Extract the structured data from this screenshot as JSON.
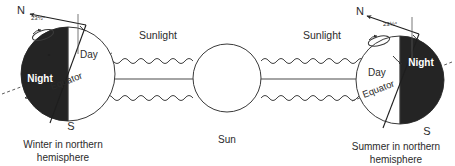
{
  "diagram": {
    "central_body": {
      "label": "Sun",
      "shape": "circle",
      "cx": 227,
      "cy": 78,
      "r": 34
    },
    "orbit_line_label": "",
    "axial_tilt_angle": "23½°",
    "sunlight_label_left": "Sunlight",
    "sunlight_label_right": "Sunlight",
    "earth_left": {
      "caption_line1": "Winter in northern",
      "caption_line2": "hemisphere",
      "north_pole_label": "N",
      "south_pole_label": "S",
      "day_label": "Day",
      "night_label": "Night",
      "equator_label": "Equator",
      "tilt_label": "23½°",
      "night_side": "left",
      "cx": 68,
      "cy": 74,
      "r": 47
    },
    "earth_right": {
      "caption_line1": "Summer in northern",
      "caption_line2": "hemisphere",
      "north_pole_label": "N",
      "south_pole_label": "S",
      "day_label": "Day",
      "night_label": "Night",
      "equator_label": "Equator",
      "tilt_label": "23½°",
      "night_side": "right",
      "cx": 400,
      "cy": 80,
      "r": 44
    },
    "rays": {
      "count": 4,
      "style": "wavy",
      "direction_left": "pointing-left",
      "direction_right": "pointing-right"
    },
    "colors": {
      "night": "#242424",
      "line": "#3a3a3a",
      "text": "#2b2b2b",
      "background": "#ffffff",
      "night_text": "#ffffff"
    }
  }
}
